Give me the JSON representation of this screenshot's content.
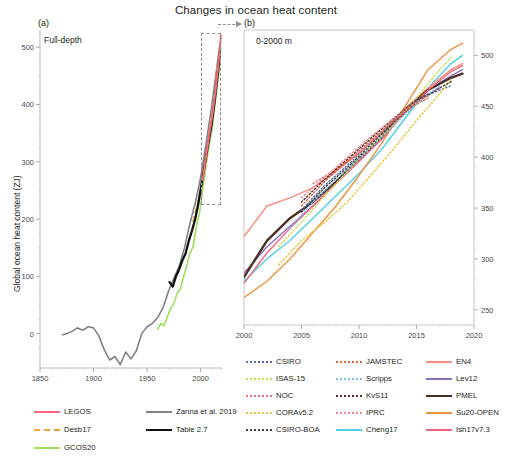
{
  "figure": {
    "title": "Changes in ocean heat content",
    "y_axis_label": "Global ocean heat content (ZJ)"
  },
  "panel_a": {
    "tag": "(a)",
    "inset_label": "Full-depth",
    "x_ticks": [
      "1850",
      "1900",
      "1950",
      "2000"
    ],
    "y_ticks": [
      "0",
      "100",
      "200",
      "300",
      "400",
      "500"
    ],
    "xlim": [
      1850,
      2020
    ],
    "ylim": [
      -60,
      530
    ],
    "zoom_box": {
      "x0": 2000,
      "x1": 2019,
      "y0": 225,
      "y1": 525
    }
  },
  "panel_b": {
    "tag": "(b)",
    "inset_label": "0-2000 m",
    "x_ticks": [
      "2000",
      "2005",
      "2010",
      "2015",
      "2020"
    ],
    "y_ticks": [
      "250",
      "300",
      "350",
      "400",
      "450",
      "500"
    ],
    "xlim": [
      2000,
      2020
    ],
    "ylim": [
      235,
      525
    ]
  },
  "legend_a": {
    "items": [
      {
        "label": "LEGOS",
        "color": "#f4697a",
        "style": "solid"
      },
      {
        "label": "Desb17",
        "color": "#f0a63c",
        "style": "dash"
      },
      {
        "label": "GCOS20",
        "color": "#9ede60",
        "style": "solid"
      },
      {
        "label": "Zanna et al. 2019",
        "color": "#808285",
        "style": "solid"
      },
      {
        "label": "Table 2.7",
        "color": "#111111",
        "style": "solid"
      }
    ]
  },
  "legend_b": {
    "items": [
      {
        "label": "CSIRO",
        "color": "#5b6fc0",
        "style": "dot"
      },
      {
        "label": "ISAS-15",
        "color": "#c9e04a",
        "style": "dot"
      },
      {
        "label": "NOC",
        "color": "#ef6d85",
        "style": "dot"
      },
      {
        "label": "CORAv5.2",
        "color": "#e8c63a",
        "style": "dot"
      },
      {
        "label": "CSIRO-BOA",
        "color": "#4a3f3c",
        "style": "dot"
      },
      {
        "label": "JAMSTEC",
        "color": "#e2683a",
        "style": "dot"
      },
      {
        "label": "Scripps",
        "color": "#7ec4e8",
        "style": "dot"
      },
      {
        "label": "KvS11",
        "color": "#5a2b2b",
        "style": "dot"
      },
      {
        "label": "IPRC",
        "color": "#f08a92",
        "style": "dot"
      },
      {
        "label": "Cheng17",
        "color": "#4fd2e0",
        "style": "solid"
      },
      {
        "label": "EN4",
        "color": "#f58f80",
        "style": "solid"
      },
      {
        "label": "Lev12",
        "color": "#8b6fc0",
        "style": "solid"
      },
      {
        "label": "PMEL",
        "color": "#4a3228",
        "style": "solid"
      },
      {
        "label": "Su20-OPEN",
        "color": "#f0923c",
        "style": "solid"
      },
      {
        "label": "Ish17v7.3",
        "color": "#f4647f",
        "style": "solid"
      }
    ]
  },
  "chart_data": [
    {
      "id": "panel_a",
      "type": "line",
      "title": "Full-depth",
      "xlabel": "",
      "ylabel": "Global ocean heat content (ZJ)",
      "xlim": [
        1850,
        2020
      ],
      "ylim": [
        -60,
        530
      ],
      "grid": false,
      "legend_position": "below-left",
      "series": [
        {
          "name": "Zanna et al. 2019",
          "color": "#808285",
          "style": "solid",
          "x": [
            1871,
            1875,
            1880,
            1885,
            1890,
            1895,
            1900,
            1905,
            1910,
            1915,
            1920,
            1925,
            1930,
            1935,
            1940,
            1945,
            1950,
            1955,
            1960,
            1965,
            1970,
            1975,
            1980,
            1985,
            1990,
            1995,
            2000,
            2005,
            2010,
            2015,
            2018
          ],
          "y": [
            -2,
            0,
            4,
            10,
            6,
            12,
            10,
            -4,
            -28,
            -46,
            -40,
            -54,
            -32,
            -44,
            -30,
            0,
            12,
            18,
            28,
            46,
            74,
            96,
            118,
            150,
            192,
            228,
            272,
            330,
            392,
            462,
            505
          ]
        },
        {
          "name": "GCOS20",
          "color": "#9ede60",
          "style": "solid",
          "x": [
            1960,
            1963,
            1966,
            1969,
            1972,
            1975,
            1978,
            1981,
            1984,
            1987,
            1990,
            1993,
            1996,
            1999,
            2002,
            2005,
            2008,
            2011,
            2014,
            2017,
            2019
          ],
          "y": [
            8,
            18,
            14,
            30,
            44,
            52,
            70,
            78,
            98,
            118,
            140,
            152,
            186,
            210,
            252,
            292,
            330,
            360,
            408,
            455,
            500
          ]
        },
        {
          "name": "Table 2.7",
          "color": "#111111",
          "style": "solid",
          "x": [
            1971,
            1974,
            1977,
            1980,
            1983,
            1986,
            1989,
            1992,
            1995,
            1998,
            2001,
            2004,
            2007,
            2010,
            2013,
            2016,
            2018
          ],
          "y": [
            90,
            82,
            100,
            112,
            128,
            140,
            162,
            180,
            200,
            228,
            262,
            296,
            330,
            362,
            404,
            452,
            492
          ]
        },
        {
          "name": "LEGOS",
          "color": "#f4697a",
          "style": "solid",
          "x": [
            2002,
            2005,
            2008,
            2011,
            2014,
            2017,
            2019
          ],
          "y": [
            268,
            308,
            346,
            382,
            424,
            478,
            520
          ]
        },
        {
          "name": "Desb17",
          "color": "#f0a63c",
          "style": "dash",
          "x": [
            1993,
            1996,
            1999,
            2002,
            2005,
            2008,
            2011,
            2014,
            2016
          ],
          "y": [
            196,
            218,
            240,
            272,
            312,
            348,
            382,
            432,
            470
          ]
        }
      ]
    },
    {
      "id": "panel_b",
      "type": "line",
      "title": "0-2000 m",
      "xlabel": "",
      "ylabel": "Global ocean heat content (ZJ)",
      "xlim": [
        2000,
        2020
      ],
      "ylim": [
        235,
        525
      ],
      "grid": false,
      "legend_position": "below",
      "series": [
        {
          "name": "Cheng17",
          "color": "#4fd2e0",
          "style": "solid",
          "x": [
            2000,
            2002,
            2004,
            2006,
            2008,
            2010,
            2012,
            2014,
            2016,
            2018,
            2019
          ],
          "y": [
            278,
            300,
            318,
            340,
            362,
            384,
            408,
            438,
            468,
            492,
            500
          ]
        },
        {
          "name": "EN4",
          "color": "#f58f80",
          "style": "solid",
          "x": [
            2000,
            2002,
            2004,
            2006,
            2008,
            2010,
            2012,
            2014,
            2016,
            2018,
            2019
          ],
          "y": [
            322,
            352,
            360,
            370,
            386,
            404,
            424,
            448,
            468,
            486,
            492
          ]
        },
        {
          "name": "Lev12",
          "color": "#8b6fc0",
          "style": "solid",
          "x": [
            2000,
            2002,
            2004,
            2006,
            2008,
            2010,
            2012,
            2014,
            2016,
            2018,
            2019
          ],
          "y": [
            286,
            312,
            332,
            352,
            374,
            396,
            418,
            444,
            466,
            480,
            486
          ]
        },
        {
          "name": "PMEL",
          "color": "#4a3228",
          "style": "solid",
          "x": [
            2000,
            2002,
            2004,
            2006,
            2008,
            2010,
            2012,
            2014,
            2016,
            2018,
            2019
          ],
          "y": [
            282,
            318,
            340,
            356,
            376,
            398,
            420,
            446,
            466,
            478,
            482
          ]
        },
        {
          "name": "Su20-OPEN",
          "color": "#f0923c",
          "style": "solid",
          "x": [
            2000,
            2002,
            2004,
            2006,
            2008,
            2010,
            2012,
            2014,
            2016,
            2018,
            2019
          ],
          "y": [
            262,
            278,
            300,
            326,
            352,
            382,
            414,
            450,
            486,
            506,
            512
          ]
        },
        {
          "name": "Ish17v7.3",
          "color": "#f4647f",
          "style": "solid",
          "x": [
            2000,
            2002,
            2004,
            2006,
            2008,
            2010,
            2012,
            2014,
            2016,
            2018,
            2019
          ],
          "y": [
            276,
            306,
            330,
            352,
            374,
            396,
            418,
            444,
            466,
            484,
            490
          ]
        },
        {
          "name": "CSIRO",
          "color": "#5b6fc0",
          "style": "dot",
          "x": [
            2005,
            2007,
            2009,
            2011,
            2013,
            2015,
            2017,
            2018
          ],
          "y": [
            348,
            372,
            392,
            414,
            436,
            456,
            466,
            470
          ]
        },
        {
          "name": "ISAS-15",
          "color": "#c9e04a",
          "style": "dot",
          "x": [
            2003,
            2005,
            2007,
            2009,
            2011,
            2013,
            2015,
            2017,
            2018
          ],
          "y": [
            312,
            336,
            362,
            386,
            410,
            432,
            458,
            486,
            498
          ]
        },
        {
          "name": "NOC",
          "color": "#ef6d85",
          "style": "dot",
          "x": [
            2006,
            2008,
            2010,
            2012,
            2014,
            2016,
            2017
          ],
          "y": [
            374,
            388,
            404,
            424,
            444,
            462,
            468
          ]
        },
        {
          "name": "CORAv5.2",
          "color": "#e8c63a",
          "style": "dot",
          "x": [
            2003,
            2005,
            2007,
            2009,
            2011,
            2013,
            2015,
            2017,
            2018
          ],
          "y": [
            294,
            318,
            336,
            356,
            382,
            408,
            436,
            462,
            476
          ]
        },
        {
          "name": "CSIRO-BOA",
          "color": "#4a3f3c",
          "style": "dot",
          "x": [
            2005,
            2007,
            2009,
            2011,
            2013,
            2015,
            2017,
            2018
          ],
          "y": [
            346,
            370,
            390,
            412,
            434,
            454,
            468,
            474
          ]
        },
        {
          "name": "JAMSTEC",
          "color": "#e2683a",
          "style": "dot",
          "x": [
            2005,
            2007,
            2009,
            2011,
            2013,
            2015,
            2016
          ],
          "y": [
            352,
            376,
            396,
            416,
            436,
            452,
            458
          ]
        },
        {
          "name": "Scripps",
          "color": "#7ec4e8",
          "style": "dot",
          "x": [
            2004,
            2006,
            2008,
            2010,
            2012,
            2014,
            2016,
            2017
          ],
          "y": [
            330,
            356,
            378,
            398,
            420,
            442,
            462,
            470
          ]
        },
        {
          "name": "KvS11",
          "color": "#5a2b2b",
          "style": "dot",
          "x": [
            2005,
            2007,
            2009,
            2011,
            2013,
            2015,
            2016
          ],
          "y": [
            356,
            378,
            398,
            418,
            438,
            456,
            462
          ]
        },
        {
          "name": "IPRC",
          "color": "#f08a92",
          "style": "dot",
          "x": [
            2005,
            2007,
            2009,
            2011,
            2013,
            2015,
            2016
          ],
          "y": [
            360,
            380,
            400,
            420,
            438,
            454,
            460
          ]
        }
      ]
    }
  ]
}
